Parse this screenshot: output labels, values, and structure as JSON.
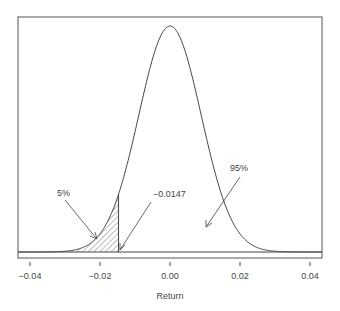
{
  "chart_data": {
    "type": "line",
    "title": "",
    "xlabel": "Return",
    "ylabel": "",
    "xlim": [
      -0.0435,
      0.0435
    ],
    "xticks": [
      -0.04,
      -0.02,
      0.0,
      0.02,
      0.04
    ],
    "xtick_labels": [
      "−0.04",
      "−0.02",
      "0.00",
      "0.02",
      "0.04"
    ],
    "grid": false,
    "legend": null,
    "series": [
      {
        "name": "Normal density",
        "distribution": "normal",
        "mean": 0.0,
        "sd": 0.0089,
        "x": [
          -0.04,
          -0.03,
          -0.02,
          -0.0147,
          -0.01,
          0.0,
          0.01,
          0.02,
          0.03,
          0.04
        ],
        "relative_density": [
          4e-05,
          0.0034,
          0.08,
          0.255,
          0.532,
          1.0,
          0.532,
          0.08,
          0.0034,
          4e-05
        ]
      }
    ],
    "shaded_region": {
      "from": -0.0435,
      "to": -0.0147,
      "pattern": "hatched",
      "probability": 0.05
    },
    "annotations": [
      {
        "text": "5%",
        "points_to": "shaded left tail"
      },
      {
        "text": "−0.0147",
        "points_to": "x = -0.0147 (VaR cutoff)"
      },
      {
        "text": "95%",
        "points_to": "area under curve right of cutoff"
      }
    ]
  },
  "labels": {
    "xlabel": "Return",
    "ticks": [
      "−0.04",
      "−0.02",
      "0.00",
      "0.02",
      "0.04"
    ],
    "ann_5": "5%",
    "ann_cutoff": "−0.0147",
    "ann_95": "95%"
  }
}
